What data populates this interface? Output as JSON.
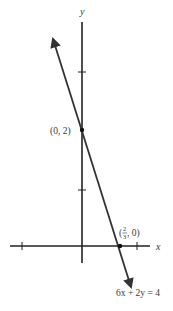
{
  "diagram": {
    "type": "line-graph",
    "equation": "6x + 2y = 4",
    "axes": {
      "x_label": "x",
      "y_label": "y"
    },
    "points": [
      {
        "label": "(0, 2)",
        "x": 0,
        "y": 2
      },
      {
        "label_prefix": "(",
        "frac_num": "2",
        "frac_den": "3",
        "label_suffix": ", 0)",
        "x": 0.6667,
        "y": 0
      }
    ],
    "ticks": {
      "x": [
        -1,
        1
      ],
      "y": [
        1,
        3
      ]
    },
    "colors": {
      "line": "#333333",
      "axis": "#222222",
      "text": "#3a3a3a"
    }
  }
}
